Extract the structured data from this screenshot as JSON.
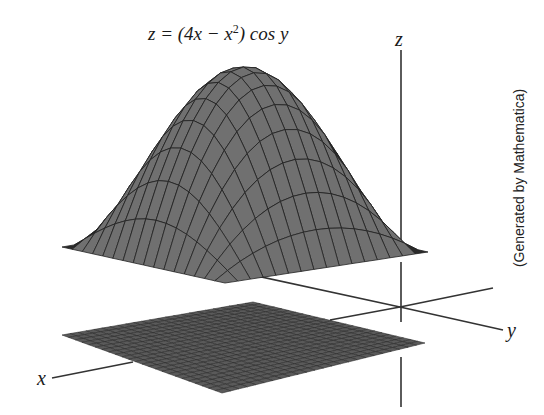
{
  "title": {
    "prefix": "z = (4x − x",
    "exponent": "2",
    "suffix": ") cos y"
  },
  "axes": {
    "x_label": "x",
    "y_label": "y",
    "z_label": "z",
    "origin_px": [
      400,
      307
    ]
  },
  "credit": "(Generated by Mathematica)",
  "colors": {
    "surface_fill": "#707070",
    "surface_under": "#2a2a2a",
    "grid_line": "#222222",
    "floor_fill": "#5a5a5a",
    "floor_grid": "#2e2e2e",
    "axis_line": "#333333"
  },
  "chart_data": {
    "type": "surface3d",
    "function": "(4*x - x^2) * cos(y)",
    "x_range": [
      0,
      4
    ],
    "y_range": [
      -1.5708,
      1.5708
    ],
    "z_range": [
      0,
      4
    ],
    "grid_divisions": {
      "x": 16,
      "y": 16
    },
    "peak": {
      "x": 2,
      "y": 0,
      "z": 4
    },
    "projection_plane": {
      "type": "grid",
      "divisions": 24,
      "z": "floor"
    },
    "axis_labels": [
      "x",
      "y",
      "z"
    ],
    "annotation": "(Generated by Mathematica)"
  }
}
